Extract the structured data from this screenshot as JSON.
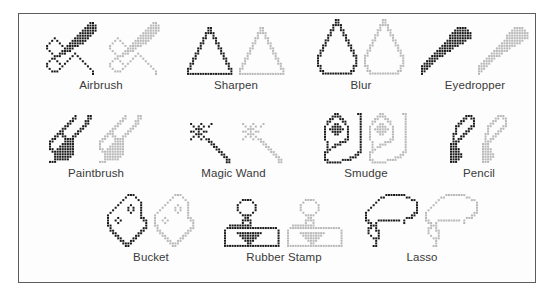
{
  "figure": {
    "background_color": "#ffffff",
    "panel_background": "#fdfdfd",
    "border_color": "#5c5c5c",
    "label_color": "#3a3a3a",
    "icon_dark_color": "#1a1a1a",
    "icon_light_color": "#b8b8b8"
  },
  "rows": [
    {
      "row_index": 0,
      "tools": [
        {
          "label": "Airbrush",
          "x": 12,
          "width": 140,
          "icon": "airbrush-icon"
        },
        {
          "label": "Sharpen",
          "x": 152,
          "width": 130,
          "icon": "sharpen-icon"
        },
        {
          "label": "Blur",
          "x": 282,
          "width": 120,
          "icon": "blur-icon"
        },
        {
          "label": "Eyedropper",
          "x": 396,
          "width": 120,
          "icon": "eyedropper-icon"
        }
      ]
    },
    {
      "row_index": 1,
      "tools": [
        {
          "label": "Paintbrush",
          "x": 12,
          "width": 130,
          "icon": "paintbrush-icon"
        },
        {
          "label": "Magic Wand",
          "x": 142,
          "width": 145,
          "icon": "magic-wand-icon"
        },
        {
          "label": "Smudge",
          "x": 287,
          "width": 120,
          "icon": "smudge-icon"
        },
        {
          "label": "Pencil",
          "x": 405,
          "width": 110,
          "icon": "pencil-icon"
        }
      ]
    },
    {
      "row_index": 2,
      "tools": [
        {
          "label": "Bucket",
          "x": 62,
          "width": 140,
          "icon": "bucket-icon"
        },
        {
          "label": "Rubber Stamp",
          "x": 190,
          "width": 150,
          "icon": "rubber-stamp-icon"
        },
        {
          "label": "Lasso",
          "x": 328,
          "width": 150,
          "icon": "lasso-icon"
        }
      ]
    }
  ]
}
